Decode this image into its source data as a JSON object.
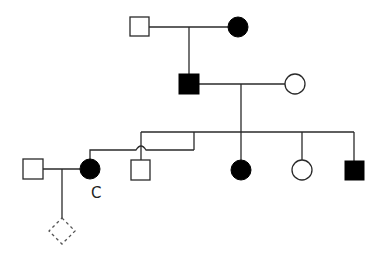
{
  "diagram": {
    "type": "pedigree",
    "colors": {
      "line": "#2a2a2a",
      "affected": "#000000",
      "unaffected": "#ffffff",
      "unknown_dashed": "#555555"
    },
    "generations": [
      {
        "level": "I",
        "individuals": [
          {
            "id": "I-1",
            "sex": "male",
            "affected": false
          },
          {
            "id": "I-2",
            "sex": "female",
            "affected": true
          }
        ]
      },
      {
        "level": "II",
        "individuals": [
          {
            "id": "II-1",
            "sex": "male",
            "affected": true
          },
          {
            "id": "II-2",
            "sex": "female",
            "affected": false
          }
        ]
      },
      {
        "level": "III",
        "individuals": [
          {
            "id": "III-spouse",
            "sex": "male",
            "affected": false
          },
          {
            "id": "C",
            "sex": "female",
            "affected": true,
            "label": "C"
          },
          {
            "id": "III-2",
            "sex": "male",
            "affected": false
          },
          {
            "id": "III-3",
            "sex": "female",
            "affected": true
          },
          {
            "id": "III-4",
            "sex": "female",
            "affected": false
          },
          {
            "id": "III-5",
            "sex": "male",
            "affected": true
          }
        ]
      },
      {
        "level": "IV",
        "individuals": [
          {
            "id": "IV-1",
            "sex": "unknown",
            "affected": false,
            "status": "unborn/pregnancy (dashed)"
          }
        ]
      }
    ],
    "labels": {
      "proband": "C"
    }
  }
}
